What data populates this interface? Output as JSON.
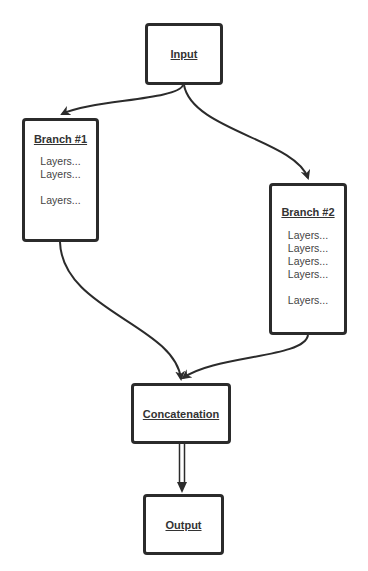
{
  "diagram": {
    "type": "flowchart",
    "colors": {
      "stroke": "#2b2b2b",
      "title_text": "#333333",
      "body_text": "#444444",
      "background": "#ffffff"
    },
    "nodes": {
      "input": {
        "title": "Input"
      },
      "branch1": {
        "title": "Branch #1",
        "layers": [
          "Layers...",
          "Layers...",
          "Layers..."
        ]
      },
      "branch2": {
        "title": "Branch #2",
        "layers": [
          "Layers...",
          "Layers...",
          "Layers...",
          "Layers...",
          "Layers..."
        ]
      },
      "concat": {
        "title": "Concatenation"
      },
      "output": {
        "title": "Output"
      }
    },
    "edges": [
      {
        "from": "Input",
        "to": "Branch #1",
        "style": "curved-arrow"
      },
      {
        "from": "Input",
        "to": "Branch #2",
        "style": "curved-arrow"
      },
      {
        "from": "Branch #1",
        "to": "Concatenation",
        "style": "curved-arrow"
      },
      {
        "from": "Branch #2",
        "to": "Concatenation",
        "style": "curved-arrow"
      },
      {
        "from": "Concatenation",
        "to": "Output",
        "style": "double-line-arrow"
      }
    ]
  }
}
